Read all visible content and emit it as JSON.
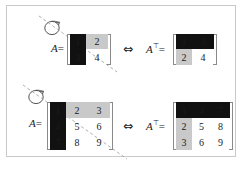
{
  "figure": {
    "caption": "",
    "border_color": "#c9c9c9",
    "background": "#ffffff",
    "equivalence_symbol": "⇔",
    "colors": {
      "highlight_black": "#111111",
      "highlight_gray": "#c9c9c9",
      "bracket": "#8a8a8a",
      "axis_dashed": "#9a9a9a",
      "text": "#1a1a1a"
    }
  },
  "rows": [
    {
      "id": "row-2x2",
      "rotation_icon": "rotation-arrow-icon",
      "left": {
        "label_base": "A",
        "label_sup": "",
        "equals": "=",
        "rows": 2,
        "cols": 2,
        "cells": [
          [
            {
              "v": "1",
              "style": "black"
            },
            {
              "v": "2",
              "style": "gray"
            }
          ],
          [
            {
              "v": "3",
              "style": "black"
            },
            {
              "v": "4",
              "style": "plain"
            }
          ]
        ]
      },
      "relation": "⇔",
      "right": {
        "label_base": "A",
        "label_sup": "⊤",
        "equals": "=",
        "rows": 2,
        "cols": 2,
        "cells": [
          [
            {
              "v": "1",
              "style": "black"
            },
            {
              "v": "3",
              "style": "black"
            }
          ],
          [
            {
              "v": "2",
              "style": "gray"
            },
            {
              "v": "4",
              "style": "plain"
            }
          ]
        ]
      }
    },
    {
      "id": "row-3x3",
      "rotation_icon": "rotation-arrow-icon",
      "left": {
        "label_base": "A",
        "label_sup": "",
        "equals": "=",
        "rows": 3,
        "cols": 3,
        "cells": [
          [
            {
              "v": "1",
              "style": "black"
            },
            {
              "v": "2",
              "style": "gray"
            },
            {
              "v": "3",
              "style": "gray"
            }
          ],
          [
            {
              "v": "4",
              "style": "black"
            },
            {
              "v": "5",
              "style": "plain"
            },
            {
              "v": "6",
              "style": "plain"
            }
          ],
          [
            {
              "v": "7",
              "style": "black"
            },
            {
              "v": "8",
              "style": "plain"
            },
            {
              "v": "9",
              "style": "plain"
            }
          ]
        ]
      },
      "relation": "⇔",
      "right": {
        "label_base": "A",
        "label_sup": "⊤",
        "equals": "=",
        "rows": 3,
        "cols": 3,
        "cells": [
          [
            {
              "v": "1",
              "style": "black"
            },
            {
              "v": "4",
              "style": "black"
            },
            {
              "v": "7",
              "style": "black"
            }
          ],
          [
            {
              "v": "2",
              "style": "gray"
            },
            {
              "v": "5",
              "style": "plain"
            },
            {
              "v": "8",
              "style": "plain"
            }
          ],
          [
            {
              "v": "3",
              "style": "gray"
            },
            {
              "v": "6",
              "style": "plain"
            },
            {
              "v": "9",
              "style": "plain"
            }
          ]
        ]
      }
    }
  ]
}
